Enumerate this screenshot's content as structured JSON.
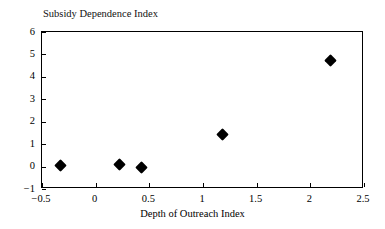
{
  "chart_data": {
    "type": "scatter",
    "title": "Subsidy Dependence Index",
    "xlabel": "Depth of Outreach Index",
    "ylabel": "",
    "xlim": [
      -0.5,
      2.5
    ],
    "ylim": [
      -1,
      6
    ],
    "grid": false,
    "legend": null,
    "marker": "filled-diamond",
    "marker_color": "#000000",
    "xticks": [
      -0.5,
      0,
      0.5,
      1,
      1.5,
      2,
      2.5
    ],
    "xticklabels": [
      "−0.5",
      "0",
      "0.5",
      "1",
      "1.5",
      "2",
      "2.5"
    ],
    "yticks": [
      -1,
      0,
      1,
      2,
      3,
      4,
      5,
      6
    ],
    "yticklabels": [
      "−1",
      "0",
      "1",
      "2",
      "3",
      "4",
      "5",
      "6"
    ],
    "points": [
      {
        "x": -0.33,
        "y": 0.04
      },
      {
        "x": 0.22,
        "y": 0.1
      },
      {
        "x": 0.43,
        "y": -0.03
      },
      {
        "x": 1.18,
        "y": 1.43
      },
      {
        "x": 2.19,
        "y": 4.73
      }
    ]
  }
}
